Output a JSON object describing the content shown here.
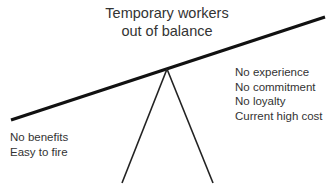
{
  "title": {
    "line1": "Temporary workers",
    "line2": "out of balance"
  },
  "right_side": {
    "items": [
      "No experience",
      "No commitment",
      "No loyalty",
      "Current high cost"
    ]
  },
  "left_side": {
    "items": [
      "No benefits",
      "Easy to fire"
    ]
  },
  "colors": {
    "line": "#111111",
    "text": "#333333",
    "background": "#ffffff"
  }
}
